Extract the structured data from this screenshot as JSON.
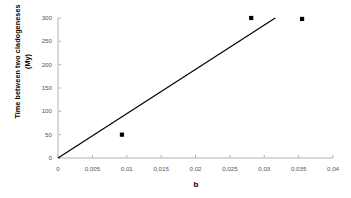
{
  "chart_data": {
    "type": "scatter",
    "title": "",
    "xlabel": "b",
    "ylabel": "Time between two cladogeneses (My)",
    "ylabel_line1": "Time between two cladogeneses",
    "ylabel_line2": "(My)",
    "xlim": [
      0,
      0.04
    ],
    "ylim": [
      0,
      300
    ],
    "grid": false,
    "legend": null,
    "xticks": [
      0,
      0.005,
      0.01,
      0.015,
      0.02,
      0.025,
      0.03,
      0.035,
      0.04
    ],
    "xtick_labels": [
      "0",
      "0,005",
      "0,01",
      "0,015",
      "0,02",
      "0,025",
      "0,03",
      "0,035",
      "0,04"
    ],
    "yticks": [
      0,
      50,
      100,
      150,
      200,
      250,
      300
    ],
    "ytick_labels": [
      "0",
      "50",
      "100",
      "150",
      "200",
      "250",
      "300"
    ],
    "points": [
      {
        "x": 0.0093,
        "y": 50
      },
      {
        "x": 0.0281,
        "y": 300
      },
      {
        "x": 0.0355,
        "y": 298
      }
    ],
    "marker": "square",
    "marker_color": "#000000",
    "trend_line": {
      "x": [
        0,
        0.0316
      ],
      "y": [
        0,
        300
      ],
      "color": "#000000"
    },
    "axis_color": "#b3b3b3",
    "background": "#ffffff"
  }
}
